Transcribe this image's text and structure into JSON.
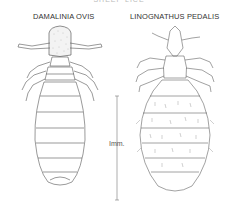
{
  "figure": {
    "top_caption": "SHEEP LICE",
    "specimens": [
      {
        "name": "DAMALINIA OVIS",
        "type": "chewing louse"
      },
      {
        "name": "LINOGNATHUS PEDALIS",
        "type": "sucking louse"
      }
    ],
    "scale_bar": {
      "label": "Imm.",
      "orientation": "vertical"
    },
    "colors": {
      "line": "#555555",
      "head_stipple": "#888888",
      "background": "#ffffff"
    }
  }
}
